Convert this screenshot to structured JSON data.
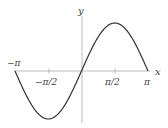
{
  "chart_data": {
    "type": "line",
    "title": "",
    "xlabel": "x",
    "ylabel": "y",
    "function": "y = sin(x)",
    "xlim": [
      -3.14159,
      3.14159
    ],
    "ylim": [
      -1,
      1
    ],
    "grid": false,
    "x_ticks": [
      {
        "value": -3.14159,
        "label": "−π"
      },
      {
        "value": -1.5708,
        "label": "−π/2"
      },
      {
        "value": 1.5708,
        "label": "π/2"
      },
      {
        "value": 3.14159,
        "label": "π"
      }
    ],
    "series": [
      {
        "name": "sin(x)",
        "x": [
          -3.14159,
          -2.35619,
          -1.5708,
          -0.7854,
          0,
          0.7854,
          1.5708,
          2.35619,
          3.14159
        ],
        "values": [
          0,
          -0.7071,
          -1,
          -0.7071,
          0,
          0.7071,
          1,
          0.7071,
          0
        ]
      }
    ]
  },
  "labels": {
    "x_axis": "x",
    "y_axis": "y",
    "neg_pi": "−π",
    "neg_half_pi": "−π/2",
    "half_pi": "π/2",
    "pi": "π"
  },
  "colors": {
    "curve": "#333333",
    "axis": "#999999",
    "text": "#444444"
  }
}
